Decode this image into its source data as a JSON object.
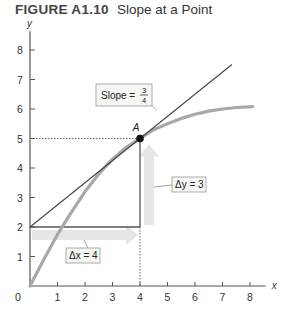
{
  "figure": {
    "number": "FIGURE A1.10",
    "title": "Slope at a Point"
  },
  "chart_data": {
    "type": "line",
    "title": "Slope at a Point",
    "xlabel": "x",
    "ylabel": "y",
    "xlim": [
      0,
      8.5
    ],
    "ylim": [
      0,
      8.5
    ],
    "x_ticks": [
      0,
      1,
      2,
      3,
      4,
      5,
      6,
      7,
      8
    ],
    "y_ticks": [
      1,
      2,
      3,
      4,
      5,
      6,
      7,
      8
    ],
    "x_tick_labels": [
      "0",
      "1",
      "2",
      "3",
      "4",
      "5",
      "6",
      "7",
      "8"
    ],
    "y_tick_labels": [
      "1",
      "2",
      "3",
      "4",
      "5",
      "6",
      "7",
      "8"
    ],
    "grid": false,
    "series": [
      {
        "name": "curve",
        "color": "#a8a8a8",
        "points": [
          [
            0,
            0
          ],
          [
            0.5,
            0.9
          ],
          [
            1,
            1.75
          ],
          [
            1.5,
            2.5
          ],
          [
            2,
            3.2
          ],
          [
            2.5,
            3.8
          ],
          [
            3,
            4.3
          ],
          [
            3.5,
            4.7
          ],
          [
            4,
            5.0
          ],
          [
            4.5,
            5.3
          ],
          [
            5,
            5.5
          ],
          [
            5.5,
            5.68
          ],
          [
            6,
            5.82
          ],
          [
            6.5,
            5.93
          ],
          [
            7,
            6.0
          ],
          [
            7.5,
            6.05
          ],
          [
            8.1,
            6.08
          ]
        ]
      },
      {
        "name": "tangent",
        "color": "#444444",
        "points": [
          [
            0,
            2
          ],
          [
            7.33,
            7.5
          ]
        ]
      }
    ],
    "point": {
      "label": "A",
      "x": 4,
      "y": 5
    },
    "run": {
      "from": [
        0,
        2
      ],
      "to": [
        4,
        2
      ],
      "label": "Δx = 4"
    },
    "rise": {
      "from": [
        4,
        2
      ],
      "to": [
        4,
        5
      ],
      "label": "Δy = 3"
    },
    "slope_label": {
      "text": "Slope =",
      "numerator": "3",
      "denominator": "4"
    },
    "arrow_color": "#e6e6e6"
  }
}
